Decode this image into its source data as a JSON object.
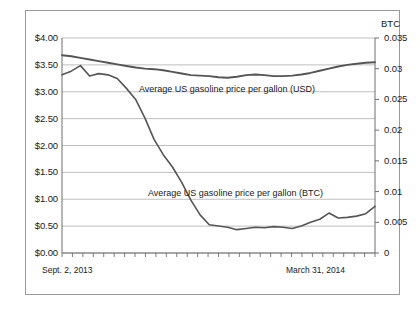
{
  "chart_data": {
    "type": "line",
    "title": "",
    "subtitle": "",
    "xlabel": "",
    "ylabel": "",
    "grid": true,
    "legend_position": "inline-annotations",
    "x_axis": {
      "start_label": "Sept. 2, 2013",
      "end_label": "March 31, 2014",
      "tick_count": 31,
      "tick_labels_shown": false
    },
    "axes": [
      {
        "id": "left",
        "name": "USD",
        "title": "",
        "ticks": [
          "$0.00",
          "$0.50",
          "$1.00",
          "$1.50",
          "$2.00",
          "$2.50",
          "$3.00",
          "$3.50",
          "$4.00"
        ],
        "values": [
          0,
          0.5,
          1.0,
          1.5,
          2.0,
          2.5,
          3.0,
          3.5,
          4.0
        ],
        "ylim": [
          0,
          4.0
        ]
      },
      {
        "id": "right",
        "name": "BTC",
        "title": "BTC",
        "ticks": [
          "0",
          "0.005",
          "0.01",
          "0.015",
          "0.02",
          "0.025",
          "0.03",
          "0.035"
        ],
        "values": [
          0,
          0.005,
          0.01,
          0.015,
          0.02,
          0.025,
          0.03,
          0.035
        ],
        "ylim": [
          0,
          0.035
        ]
      }
    ],
    "series": [
      {
        "name": "Average US gasoline price per gallon (USD)",
        "axis": "left",
        "color": "#555555",
        "annotation": "Average US gasoline price per gallon (USD)",
        "values": [
          3.68,
          3.66,
          3.63,
          3.6,
          3.57,
          3.54,
          3.51,
          3.48,
          3.45,
          3.43,
          3.42,
          3.4,
          3.37,
          3.34,
          3.31,
          3.3,
          3.29,
          3.27,
          3.26,
          3.28,
          3.31,
          3.32,
          3.31,
          3.29,
          3.29,
          3.3,
          3.32,
          3.35,
          3.39,
          3.43,
          3.47,
          3.5,
          3.52,
          3.54,
          3.55
        ]
      },
      {
        "name": "Average US gasoline price per gallon (BTC)",
        "axis": "right",
        "color": "#555555",
        "annotation": "Average US gasoline  price per gallon (BTC)",
        "values": [
          0.029,
          0.0296,
          0.0305,
          0.0288,
          0.0292,
          0.029,
          0.0284,
          0.0268,
          0.025,
          0.022,
          0.0185,
          0.016,
          0.014,
          0.0115,
          0.0086,
          0.0062,
          0.0046,
          0.0044,
          0.0042,
          0.0038,
          0.004,
          0.0042,
          0.0041,
          0.0043,
          0.0042,
          0.004,
          0.0044,
          0.005,
          0.0055,
          0.0065,
          0.0057,
          0.0058,
          0.006,
          0.0064,
          0.0076
        ]
      }
    ]
  },
  "labels": {
    "btc_axis_title": "BTC",
    "annotation_usd": "Average US gasoline price per gallon (USD)",
    "annotation_btc": "Average US gasoline  price per gallon (BTC)",
    "date_start": "Sept. 2, 2013",
    "date_end": "March 31, 2014"
  },
  "colors": {
    "line": "#555555",
    "grid": "#b8b8b8",
    "axis": "#6e6e6e",
    "frame": "#9a9a9a",
    "text": "#1a1a1a",
    "background": "#ffffff"
  }
}
